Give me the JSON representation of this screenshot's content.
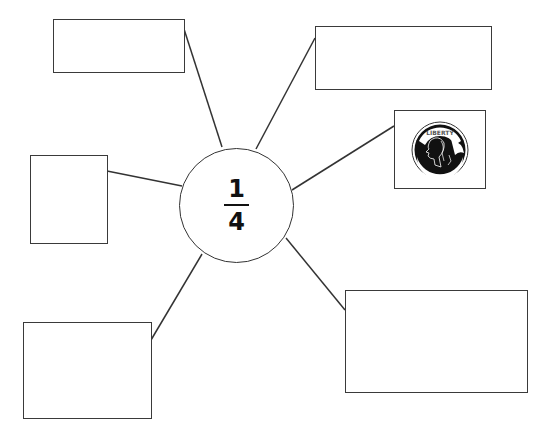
{
  "diagram": {
    "type": "concept-web",
    "center": {
      "numerator": "1",
      "denominator": "4",
      "fraction_label": "1/4"
    },
    "boxes": [
      {
        "id": "top-left",
        "content": ""
      },
      {
        "id": "top-right",
        "content": ""
      },
      {
        "id": "right",
        "content": "quarter coin image",
        "icon": "quarter-coin-icon",
        "coin_text": "LIBERTY"
      },
      {
        "id": "left",
        "content": ""
      },
      {
        "id": "bottom-left",
        "content": ""
      },
      {
        "id": "bottom-right",
        "content": ""
      }
    ],
    "colors": {
      "stroke": "#333333",
      "background": "#ffffff",
      "text": "#111111"
    }
  }
}
